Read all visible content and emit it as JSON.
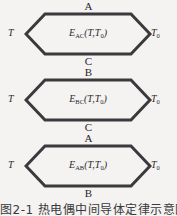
{
  "figure": {
    "type": "thermocouple-emf-diagram",
    "background_color": "#f4f3f1",
    "stroke_color": "#3a3a3e",
    "text_color": "#2a2a2e",
    "cells": [
      {
        "id": "cell-ac",
        "top_letter": "A",
        "bottom_letter": "C",
        "formula_main": "E",
        "formula_subscript": "AC",
        "formula_args": "(T,T",
        "formula_args_sub": "0",
        "formula_args_close": ")",
        "formula_full": "E_AC(T,T0)",
        "left_temp": "T",
        "right_temp": "T",
        "right_temp_sub": "0"
      },
      {
        "id": "cell-bc",
        "top_letter": "B",
        "bottom_letter": "C",
        "formula_main": "E",
        "formula_subscript": "BC",
        "formula_args": "(T,T",
        "formula_args_sub": "0",
        "formula_args_close": ")",
        "formula_full": "E_BC(T,T0)",
        "left_temp": "T",
        "right_temp": "T",
        "right_temp_sub": "0"
      },
      {
        "id": "cell-ab",
        "top_letter": "A",
        "bottom_letter": "B",
        "formula_main": "E",
        "formula_subscript": "AB",
        "formula_args": "(T,T",
        "formula_args_sub": "0",
        "formula_args_close": ")",
        "formula_full": "E_AB(T,T0)",
        "left_temp": "T",
        "right_temp": "T",
        "right_temp_sub": "0"
      }
    ],
    "caption": "图2-1  热电偶中间导体定律示意图"
  }
}
